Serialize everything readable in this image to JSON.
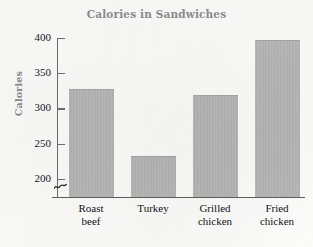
{
  "chart_data": {
    "type": "bar",
    "title": "Calories in Sandwiches",
    "xlabel": "",
    "ylabel": "Calories",
    "categories": [
      "Roast beef",
      "Turkey",
      "Grilled chicken",
      "Fried chicken"
    ],
    "category_lines": [
      [
        "Roast",
        "beef"
      ],
      [
        "Turkey",
        ""
      ],
      [
        "Grilled",
        "chicken"
      ],
      [
        "Fried",
        "chicken"
      ]
    ],
    "values": [
      327,
      232,
      319,
      397
    ],
    "ylim": [
      175,
      400
    ],
    "y_ticks": [
      400,
      350,
      300,
      250,
      200
    ],
    "y_tick_labels": [
      "400",
      "350",
      "300",
      "250",
      "200"
    ],
    "axis_break": true,
    "axis_break_symbol": "~",
    "grid": false,
    "legend": false,
    "bar_color": "#b4b4b4",
    "title_color": "#8e8e8e",
    "axis_label_color": "#8a8a8a",
    "tick_text_color": "#17171a",
    "axis_line_color": "#6e6e6e",
    "background_color": "#fcfcfb"
  }
}
